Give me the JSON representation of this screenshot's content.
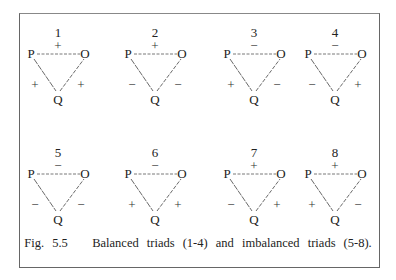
{
  "figure": {
    "caption": "Fig. 5.5   Balanced triads (1-4) and imbalanced triads (5-8).",
    "node_labels": {
      "p": "P",
      "o": "O",
      "q": "Q"
    },
    "triads": [
      {
        "number": "1",
        "po": "+",
        "pq": "+",
        "qo": "+",
        "balanced": true
      },
      {
        "number": "2",
        "po": "+",
        "pq": "−",
        "qo": "−",
        "balanced": true
      },
      {
        "number": "3",
        "po": "−",
        "pq": "+",
        "qo": "−",
        "balanced": true
      },
      {
        "number": "4",
        "po": "−",
        "pq": "−",
        "qo": "+",
        "balanced": true
      },
      {
        "number": "5",
        "po": "−",
        "pq": "−",
        "qo": "−",
        "balanced": false
      },
      {
        "number": "6",
        "po": "−",
        "pq": "+",
        "qo": "+",
        "balanced": false
      },
      {
        "number": "7",
        "po": "+",
        "pq": "−",
        "qo": "+",
        "balanced": false
      },
      {
        "number": "8",
        "po": "+",
        "pq": "+",
        "qo": "−",
        "balanced": false
      }
    ]
  }
}
